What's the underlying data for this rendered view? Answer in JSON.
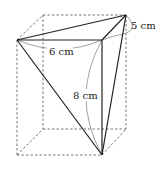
{
  "diagram": {
    "type": "geometry-box-triangular-pyramid",
    "colors": {
      "solid_edge": "#222222",
      "hidden_edge": "#666666",
      "arc": "#777777",
      "background": "#ffffff"
    },
    "labels": {
      "top_front_edge": "6 cm",
      "vertical_edge": "8 cm",
      "top_side_edge": "5 cm"
    }
  }
}
